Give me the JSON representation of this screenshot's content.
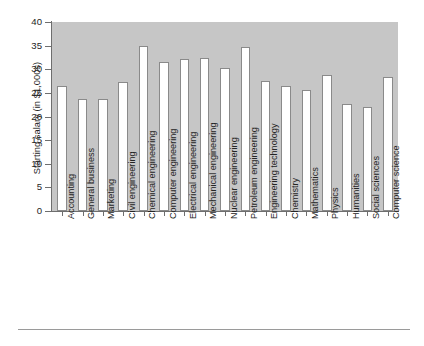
{
  "chart_data": {
    "type": "bar",
    "title": "",
    "xlabel": "",
    "ylabel": "Starting salary (in $1,000s)",
    "ylim": [
      0,
      40
    ],
    "yticks": [
      0,
      5,
      10,
      15,
      20,
      25,
      30,
      35,
      40
    ],
    "grid": false,
    "legend": null,
    "categories": [
      "Accounting",
      "General business",
      "Marketing",
      "Civil engineering",
      "Chemical engineering",
      "Computer engineering",
      "Electrical engineering",
      "Mechanical engineering",
      "Nuclear engineering",
      "Petroleum engineering",
      "Engineering technology",
      "Chemistry",
      "Mathematics",
      "Physics",
      "Humanities",
      "Social sciences",
      "Computer science"
    ],
    "values": [
      26.4,
      23.7,
      23.8,
      27.4,
      35.0,
      31.6,
      32.1,
      32.4,
      30.3,
      34.8,
      27.5,
      26.5,
      25.6,
      28.8,
      22.6,
      22.1,
      28.4
    ]
  },
  "axis": {
    "y_title": "Starting salary (in $1,000s)",
    "y_tick_labels": [
      "40",
      "35",
      "30",
      "25",
      "20",
      "15",
      "10",
      "5",
      "0"
    ]
  },
  "colors": {
    "plot_background": "#c6c6c6",
    "bar_fill": "#ffffff",
    "bar_stroke": "#8a8a8a",
    "axis": "#6e6e6e",
    "text": "#242424",
    "rule": "#9a9a9a",
    "page_background": "#ffffff"
  }
}
